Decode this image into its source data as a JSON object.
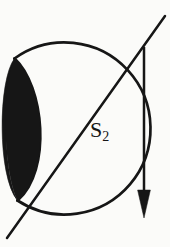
{
  "figure": {
    "kind": "geometric-diagram",
    "background_color": "#fbfbf9",
    "ink_color": "#161616",
    "width": 170,
    "height": 247,
    "labels": {
      "region_label": "a",
      "surface_label_base": "S",
      "surface_label_subscript": "2",
      "surface_label_full": "S2"
    },
    "shapes": {
      "outer_circle": {
        "type": "circle-arc",
        "center": [
          75,
          130
        ],
        "radius": 86,
        "stroke_width": 2.6,
        "filled": false
      },
      "crescent": {
        "type": "lune",
        "upper_cusp": [
          14,
          58
        ],
        "lower_cusp": [
          17,
          200
        ],
        "max_thickness": 12,
        "filled": true,
        "fill_color": "#161616"
      },
      "diagonal_line": {
        "type": "line",
        "from": [
          7,
          238
        ],
        "to": [
          165,
          16
        ],
        "stroke_width": 2.4
      },
      "vertical_arrow": {
        "type": "arrow",
        "from": [
          144,
          47
        ],
        "to": [
          144,
          217
        ],
        "direction": "down",
        "stroke_width": 2.4,
        "arrowhead": "solid-triangle",
        "arrowhead_width": 13,
        "arrowhead_length": 26
      }
    }
  }
}
